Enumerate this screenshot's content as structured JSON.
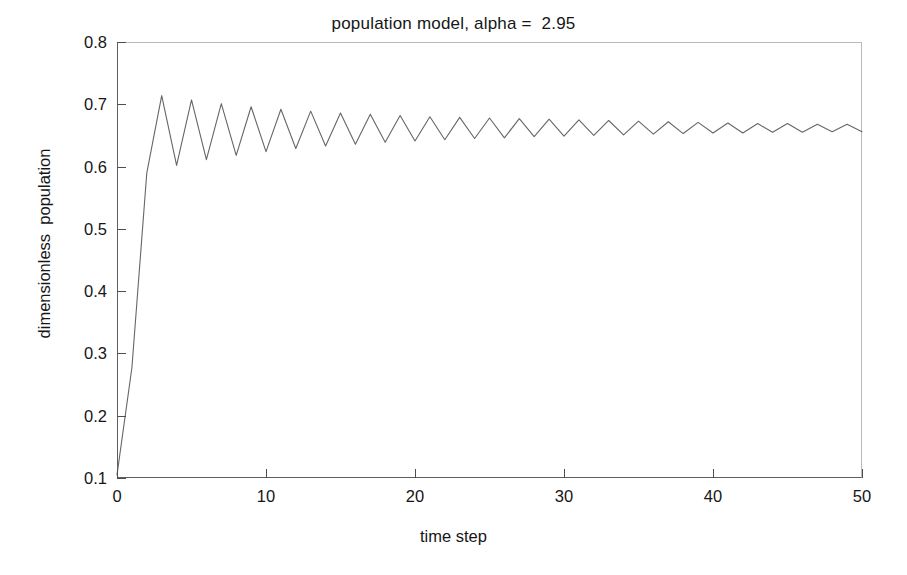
{
  "chart_data": {
    "type": "line",
    "title": "population model, alpha =  2.95",
    "xlabel": "time step",
    "ylabel": "dimensionless  population",
    "xlim": [
      0,
      50
    ],
    "ylim": [
      0.1,
      0.8
    ],
    "xticks": [
      0,
      10,
      20,
      30,
      40,
      50
    ],
    "xtick_labels": [
      "0",
      "10",
      "20",
      "30",
      "40",
      "50"
    ],
    "yticks": [
      0.1,
      0.2,
      0.3,
      0.4,
      0.5,
      0.6,
      0.7,
      0.8
    ],
    "ytick_labels": [
      "0.1",
      "0.2",
      "0.3",
      "0.4",
      "0.5",
      "0.6",
      "0.7",
      "0.8"
    ],
    "grid": false,
    "legend": false,
    "line_color": "#666666",
    "parameters": {
      "alpha": 2.95,
      "initial_population": 0.105,
      "fixed_point": 0.661
    },
    "series": [
      {
        "name": "dimensionless population",
        "x": [
          0,
          1,
          2,
          3,
          4,
          5,
          6,
          7,
          8,
          9,
          10,
          11,
          12,
          13,
          14,
          15,
          16,
          17,
          18,
          19,
          20,
          21,
          22,
          23,
          24,
          25,
          26,
          27,
          28,
          29,
          30,
          31,
          32,
          33,
          34,
          35,
          36,
          37,
          38,
          39,
          40,
          41,
          42,
          43,
          44,
          45,
          46,
          47,
          48,
          49,
          50
        ],
        "y": [
          0.105,
          0.277,
          0.59,
          0.714,
          0.602,
          0.707,
          0.611,
          0.701,
          0.618,
          0.696,
          0.624,
          0.692,
          0.629,
          0.689,
          0.633,
          0.686,
          0.636,
          0.684,
          0.639,
          0.682,
          0.641,
          0.68,
          0.643,
          0.679,
          0.645,
          0.678,
          0.646,
          0.677,
          0.648,
          0.676,
          0.649,
          0.675,
          0.65,
          0.674,
          0.651,
          0.673,
          0.652,
          0.672,
          0.653,
          0.671,
          0.654,
          0.67,
          0.654,
          0.669,
          0.655,
          0.669,
          0.655,
          0.668,
          0.656,
          0.668,
          0.656
        ]
      }
    ]
  },
  "figure": {
    "background_color": "#ffffff",
    "axis_color": "#4e4e4e"
  }
}
